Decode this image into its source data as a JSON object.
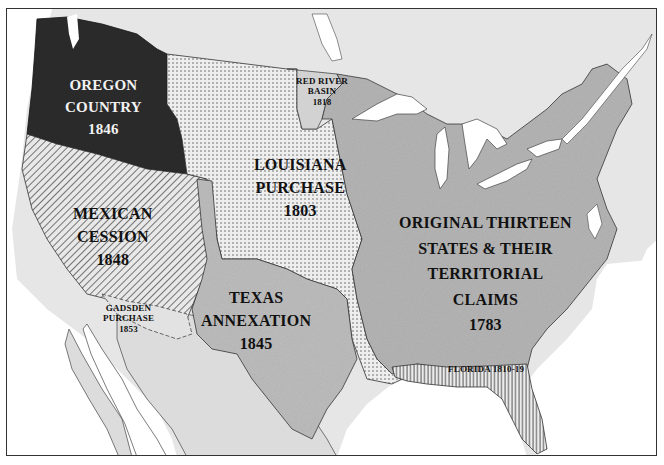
{
  "map": {
    "title": "",
    "colors": {
      "frame": "#333333",
      "canada_land": "#e6e6e6",
      "water": "#ffffff",
      "oregon": "#2a2a2a",
      "mexican_cession_hatch": "#555555",
      "louisiana_dots": "#555555",
      "texas": "#bdbdbd",
      "original_states": "#b5b5b5",
      "red_river": "#d2d2d2",
      "mexico_land": "#dcdcdc",
      "florida_hatch": "#444444"
    },
    "regions": [
      {
        "id": "oregon",
        "lines": [
          "OREGON",
          "COUNTRY",
          "1846"
        ],
        "pattern": "dark-solid"
      },
      {
        "id": "red_river",
        "lines": [
          "RED RIVER",
          "BASIN",
          "1818"
        ],
        "pattern": "light-solid"
      },
      {
        "id": "louisiana",
        "lines": [
          "LOUISIANA",
          "PURCHASE",
          "1803"
        ],
        "pattern": "dots"
      },
      {
        "id": "mexican_cession",
        "lines": [
          "MEXICAN",
          "CESSION",
          "1848"
        ],
        "pattern": "diagonal-hatch"
      },
      {
        "id": "original",
        "lines": [
          "ORIGINAL THIRTEEN",
          "STATES & THEIR",
          "TERRITORIAL",
          "CLAIMS",
          "1783"
        ],
        "pattern": "medium-solid"
      },
      {
        "id": "texas",
        "lines": [
          "TEXAS",
          "ANNEXATION",
          "1845"
        ],
        "pattern": "medium-solid"
      },
      {
        "id": "gadsden",
        "lines": [
          "GADSDEN",
          "PURCHASE",
          "1853"
        ],
        "pattern": "light-solid"
      },
      {
        "id": "florida",
        "lines": [
          "FLORIDA 1810-19"
        ],
        "pattern": "vertical-hatch"
      }
    ]
  }
}
